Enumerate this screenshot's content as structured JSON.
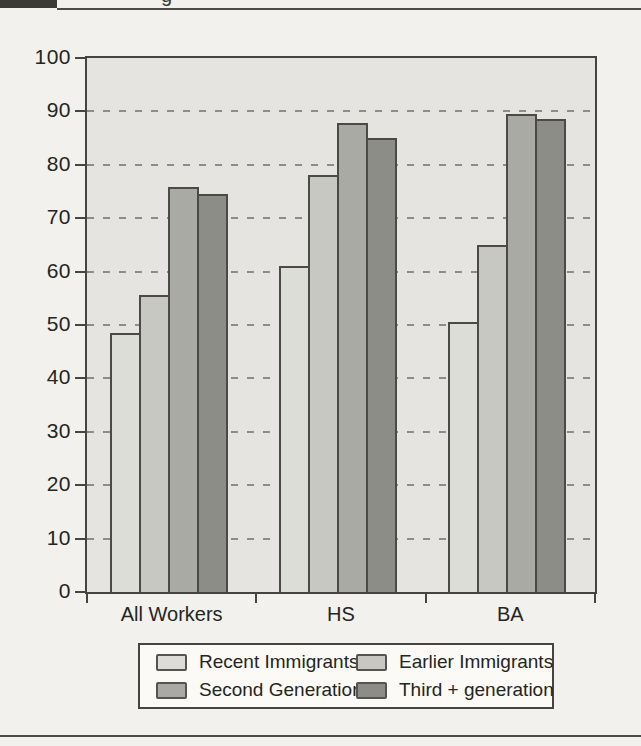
{
  "header": {
    "caption_fragment": "g"
  },
  "colors": {
    "page_bg": "#f2f1ed",
    "plot_bg": "#e5e4e0",
    "frame": "#45453f",
    "grid": "#8d8d88",
    "text": "#252521",
    "legend_bg": "#fbfaf7",
    "rule": "#4b4b47",
    "figure_box": "#3a3a38"
  },
  "chart_data": {
    "type": "bar",
    "title": "",
    "xlabel": "",
    "ylabel": "",
    "categories": [
      "All Workers",
      "HS",
      "BA"
    ],
    "series": [
      {
        "name": "Recent Immigrants",
        "color": "#dcddd6",
        "values": [
          48.5,
          61,
          50.5
        ]
      },
      {
        "name": "Earlier Immigrants",
        "color": "#c7c8c2",
        "values": [
          55.7,
          78,
          65
        ]
      },
      {
        "name": "Second Generation",
        "color": "#a9aaa4",
        "values": [
          75.8,
          87.8,
          89.5
        ]
      },
      {
        "name": "Third + generation",
        "color": "#8c8d86",
        "values": [
          74.5,
          85,
          88.5
        ]
      }
    ],
    "ylim": [
      0,
      100
    ],
    "yticks": [
      0,
      10,
      20,
      30,
      40,
      50,
      60,
      70,
      80,
      90,
      100
    ],
    "grid": {
      "horizontal": true,
      "style": "dashed",
      "at": [
        10,
        20,
        30,
        40,
        50,
        60,
        70,
        80,
        90
      ]
    },
    "legend_position": "bottom"
  }
}
